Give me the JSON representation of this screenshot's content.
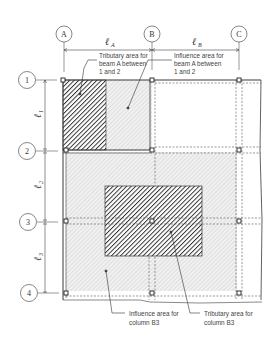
{
  "diagram": {
    "column_grid": [
      {
        "id": "A",
        "label": "A",
        "x": 63
      },
      {
        "id": "B",
        "label": "B",
        "x": 152
      },
      {
        "id": "C",
        "label": "C",
        "x": 239
      }
    ],
    "row_grid": [
      {
        "id": "1",
        "label": "1",
        "y": 80
      },
      {
        "id": "2",
        "label": "2",
        "y": 150
      },
      {
        "id": "3",
        "label": "3",
        "y": 221
      },
      {
        "id": "4",
        "label": "4",
        "y": 293
      }
    ],
    "spans": {
      "lA": {
        "symbol": "ℓ",
        "sub": "A"
      },
      "lB": {
        "symbol": "ℓ",
        "sub": "B"
      },
      "l1": {
        "symbol": "ℓ",
        "sub": "1"
      },
      "l2": {
        "symbol": "ℓ",
        "sub": "2"
      },
      "l3": {
        "symbol": "ℓ",
        "sub": "3"
      }
    },
    "annotations": {
      "trib_beam": [
        "Tributary area for",
        "beam A between",
        "1 and 2"
      ],
      "infl_beam": [
        "Influence area for",
        "beam A between",
        "1 and 2"
      ],
      "infl_col": [
        "Influence area for",
        "column B3"
      ],
      "trib_col": [
        "Tributary area for",
        "column B3"
      ]
    },
    "colors": {
      "line": "#3a3a3a",
      "dark_hatch": "#2e2e2e",
      "light_hatch": "#b9b9b9",
      "dashed": "#555555"
    }
  }
}
